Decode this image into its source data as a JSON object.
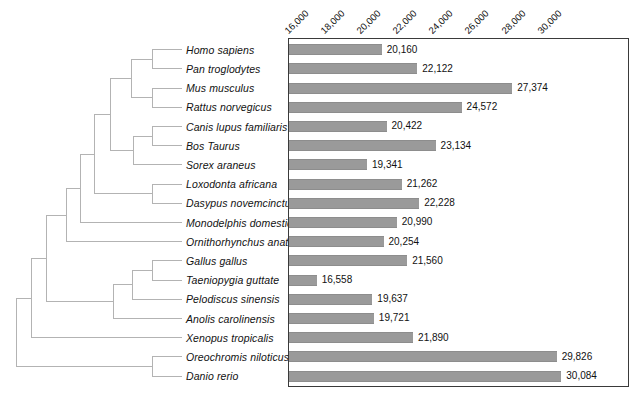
{
  "figure": {
    "title": "",
    "tree_label": "phylogenetic-cladogram",
    "bar_color": "#9a9a9a",
    "axis_color": "#3a3a3a",
    "tree_line_color": "#b0b0b0"
  },
  "chart_data": {
    "type": "bar",
    "orientation": "horizontal",
    "title": "",
    "xlabel": "",
    "ylabel": "",
    "xlim": [
      15000,
      30500
    ],
    "grid": false,
    "legend": null,
    "tick_labels": [
      "16,000",
      "18,000",
      "20,000",
      "22,000",
      "24,000",
      "26,000",
      "28,000",
      "30,000"
    ],
    "ticks": [
      16000,
      18000,
      20000,
      22000,
      24000,
      26000,
      28000,
      30000
    ],
    "categories": [
      "Homo sapiens",
      "Pan troglodytes",
      "Mus musculus",
      "Rattus norvegicus",
      "Canis lupus familiaris",
      "Bos Taurus",
      "Sorex araneus",
      "Loxodonta africana",
      "Dasypus novemcinctus",
      "Monodelphis domestica",
      "Ornithorhynchus anatinus",
      "Gallus gallus",
      "Taeniopygia guttate",
      "Pelodiscus sinensis",
      "Anolis carolinensis",
      "Xenopus tropicalis",
      "Oreochromis niloticus",
      "Danio rerio"
    ],
    "values": [
      20160,
      22122,
      27374,
      24572,
      20422,
      23134,
      19341,
      21262,
      22228,
      20990,
      20254,
      21560,
      16558,
      19637,
      19721,
      21890,
      29826,
      30084
    ],
    "value_labels": [
      "20,160",
      "22,122",
      "27,374",
      "24,572",
      "20,422",
      "23,134",
      "19,341",
      "21,262",
      "22,228",
      "20,990",
      "20,254",
      "21,560",
      "16,558",
      "19,637",
      "19,721",
      "21,890",
      "29,826",
      "30,084"
    ]
  },
  "species": [
    {
      "name": "Homo sapiens",
      "value_label": "20,160"
    },
    {
      "name": "Pan troglodytes",
      "value_label": "22,122"
    },
    {
      "name": "Mus musculus",
      "value_label": "27,374"
    },
    {
      "name": "Rattus norvegicus",
      "value_label": "24,572"
    },
    {
      "name": "Canis lupus familiaris",
      "value_label": "20,422"
    },
    {
      "name": "Bos Taurus",
      "value_label": "23,134"
    },
    {
      "name": "Sorex araneus",
      "value_label": "19,341"
    },
    {
      "name": "Loxodonta africana",
      "value_label": "21,262"
    },
    {
      "name": "Dasypus novemcinctus",
      "value_label": "22,228"
    },
    {
      "name": "Monodelphis domestica",
      "value_label": "20,990"
    },
    {
      "name": "Ornithorhynchus anatinus",
      "value_label": "20,254"
    },
    {
      "name": "Gallus gallus",
      "value_label": "21,560"
    },
    {
      "name": "Taeniopygia guttate",
      "value_label": "16,558"
    },
    {
      "name": "Pelodiscus sinensis",
      "value_label": "19,637"
    },
    {
      "name": "Anolis carolinensis",
      "value_label": "19,721"
    },
    {
      "name": "Xenopus tropicalis",
      "value_label": "21,890"
    },
    {
      "name": "Oreochromis niloticus",
      "value_label": "29,826"
    },
    {
      "name": "Danio rerio",
      "value_label": "30,084"
    }
  ]
}
